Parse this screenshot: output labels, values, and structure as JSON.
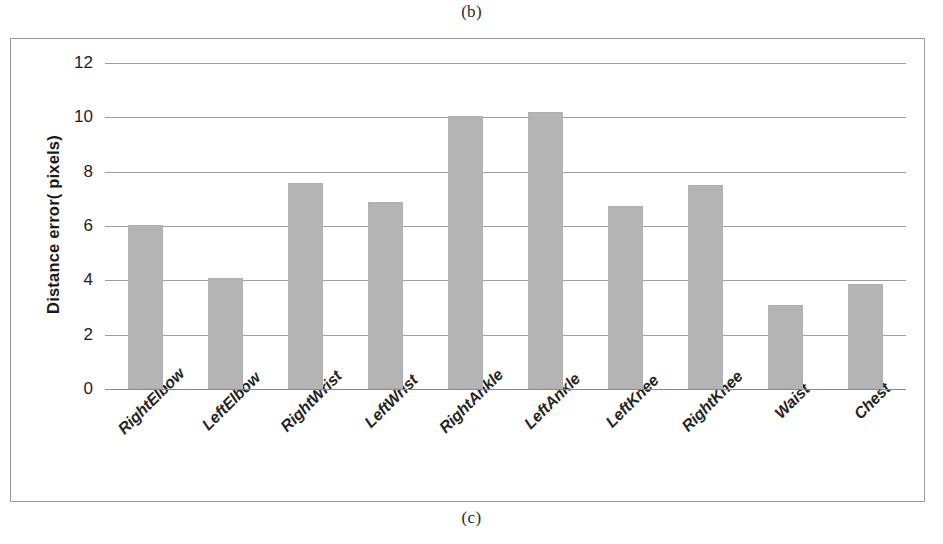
{
  "figure": {
    "caption_top": "(b)",
    "caption_bottom": "(c)"
  },
  "chart_data": {
    "type": "bar",
    "title": "",
    "xlabel": "",
    "ylabel": "Distance error( pixels)",
    "ylim": [
      0,
      12
    ],
    "yticks": [
      12,
      10,
      8,
      6,
      4,
      2,
      0
    ],
    "grid": true,
    "legend": "none",
    "bar_color": "#b4b4b4",
    "categories": [
      "RightElbow",
      "LeftElbow",
      "RightWrist",
      "LeftWrist",
      "RightAnkle",
      "LeftAnkle",
      "LeftKnee",
      "RightKnee",
      "Waist",
      "Chest"
    ],
    "values": [
      6.05,
      4.1,
      7.6,
      6.9,
      10.05,
      10.2,
      6.75,
      7.5,
      3.1,
      3.85
    ]
  }
}
